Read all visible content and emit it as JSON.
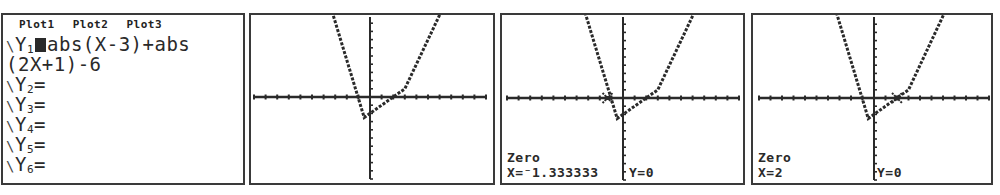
{
  "y_editor": {
    "plots": [
      "Plot1",
      "Plot2",
      "Plot3"
    ],
    "lines": [
      {
        "name": "Y1",
        "sub": "1",
        "expr": "abs(X-3)+abs",
        "selected": true
      },
      {
        "continuation": "(2X+1)-6"
      },
      {
        "name": "Y2",
        "sub": "2",
        "expr": ""
      },
      {
        "name": "Y3",
        "sub": "3",
        "expr": ""
      },
      {
        "name": "Y4",
        "sub": "4",
        "expr": ""
      },
      {
        "name": "Y5",
        "sub": "5",
        "expr": ""
      },
      {
        "name": "Y6",
        "sub": "6",
        "expr": ""
      }
    ],
    "y1_expr_line1": "abs(X-3)+abs",
    "y1_expr_line2": "(2X+1)-6",
    "equals": "="
  },
  "graphs": [
    {
      "id": "graph",
      "label": null
    },
    {
      "id": "zero-1",
      "title": "Zero",
      "x_text": "X=⁻1.333333",
      "y_text": "Y=0",
      "cursor_x": -1.333333
    },
    {
      "id": "zero-2",
      "title": "Zero",
      "x_text": "X=2",
      "y_text": "Y=0",
      "cursor_x": 2
    }
  ],
  "chart_data": {
    "type": "line",
    "title": "",
    "function": "y = abs(x-3) + abs(2x+1) - 6",
    "xlim": [
      -10,
      10
    ],
    "ylim": [
      -10,
      10
    ],
    "x_tick_step": 1,
    "y_tick_step": 1,
    "grid": false,
    "vertices": [
      {
        "x": -3.5,
        "y": 11.5
      },
      {
        "x": -0.5,
        "y": -2.5
      },
      {
        "x": 3,
        "y": 1
      },
      {
        "x": 6.5,
        "y": 11.5
      }
    ],
    "zeros": [
      -1.333333,
      2
    ]
  },
  "colors": {
    "ink": "#2a2a2a",
    "background": "#ffffff",
    "border": "#3a3a3a"
  }
}
